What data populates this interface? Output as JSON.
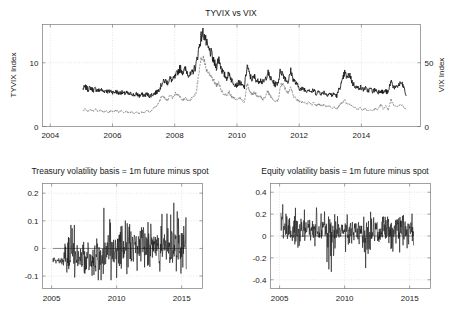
{
  "figure": {
    "background": "#ffffff",
    "line_color_primary": "#141414",
    "line_color_secondary": "#6f6f6f",
    "grid_color": "#c8c8c8"
  },
  "chart_data": [
    {
      "id": "tyvix_vs_vix",
      "type": "line",
      "title": "TYVIX vs VIX",
      "xlabel": "",
      "ylabel": "TYVIX Index",
      "y2label": "VIX Index",
      "xlim": [
        2003.75,
        2015.9
      ],
      "ylim": [
        0,
        16
      ],
      "y2lim": [
        0,
        80
      ],
      "xticks": [
        "2004",
        "2006",
        "2008",
        "2010",
        "2012",
        "2014"
      ],
      "xtick_values": [
        2004,
        2006,
        2008,
        2010,
        2012,
        2014
      ],
      "yticks": [
        "0",
        "10"
      ],
      "ytick_values": [
        0,
        10
      ],
      "y2ticks": [
        "0",
        "50"
      ],
      "y2tick_values": [
        0,
        50
      ],
      "grid": true,
      "legend": "none",
      "series": [
        {
          "name": "TYVIX Index",
          "axis": "left",
          "style": "solid",
          "color": "#141414",
          "x": [
            2005.05,
            2005.13,
            2005.21,
            2005.29,
            2005.38,
            2005.46,
            2005.54,
            2005.62,
            2005.71,
            2005.79,
            2005.87,
            2005.95,
            2006.04,
            2006.12,
            2006.2,
            2006.28,
            2006.37,
            2006.45,
            2006.53,
            2006.61,
            2006.7,
            2006.78,
            2006.86,
            2006.94,
            2007.03,
            2007.11,
            2007.19,
            2007.27,
            2007.36,
            2007.44,
            2007.52,
            2007.6,
            2007.69,
            2007.77,
            2007.85,
            2007.93,
            2008.02,
            2008.1,
            2008.18,
            2008.26,
            2008.35,
            2008.43,
            2008.51,
            2008.59,
            2008.68,
            2008.76,
            2008.84,
            2008.92,
            2009.01,
            2009.09,
            2009.17,
            2009.25,
            2009.34,
            2009.42,
            2009.5,
            2009.58,
            2009.67,
            2009.75,
            2009.83,
            2009.91,
            2010.0,
            2010.08,
            2010.16,
            2010.24,
            2010.33,
            2010.41,
            2010.49,
            2010.57,
            2010.66,
            2010.74,
            2010.82,
            2010.9,
            2010.99,
            2011.07,
            2011.15,
            2011.23,
            2011.32,
            2011.4,
            2011.48,
            2011.56,
            2011.65,
            2011.73,
            2011.81,
            2011.89,
            2011.98,
            2012.06,
            2012.14,
            2012.22,
            2012.31,
            2012.39,
            2012.47,
            2012.55,
            2012.64,
            2012.72,
            2012.8,
            2012.88,
            2012.97,
            2013.05,
            2013.13,
            2013.21,
            2013.3,
            2013.38,
            2013.46,
            2013.54,
            2013.63,
            2013.71,
            2013.79,
            2013.87,
            2013.96,
            2014.04,
            2014.12,
            2014.2,
            2014.29,
            2014.37,
            2014.45,
            2014.53,
            2014.62,
            2014.7,
            2014.78,
            2014.86,
            2014.95,
            2015.03,
            2015.11,
            2015.19,
            2015.28,
            2015.36,
            2015.44
          ],
          "y": [
            5.9,
            6.2,
            5.8,
            6.1,
            5.7,
            5.9,
            5.6,
            5.8,
            5.5,
            5.7,
            5.4,
            5.6,
            5.3,
            5.5,
            5.2,
            5.4,
            5.1,
            5.3,
            5.0,
            5.2,
            4.9,
            5.1,
            4.8,
            5.0,
            4.9,
            5.1,
            4.8,
            5.0,
            5.2,
            5.5,
            6.0,
            6.8,
            7.2,
            6.9,
            7.5,
            7.2,
            7.8,
            8.6,
            9.2,
            8.5,
            9.0,
            8.3,
            8.0,
            8.7,
            9.5,
            11.8,
            13.9,
            14.8,
            13.2,
            12.0,
            11.5,
            10.2,
            9.4,
            10.8,
            9.0,
            8.2,
            7.6,
            8.4,
            7.2,
            6.8,
            6.5,
            7.0,
            6.4,
            6.2,
            9.6,
            8.0,
            7.4,
            7.8,
            7.0,
            7.4,
            6.9,
            7.2,
            8.5,
            7.6,
            7.0,
            6.6,
            6.9,
            8.8,
            8.2,
            7.5,
            7.0,
            8.7,
            7.4,
            6.8,
            6.2,
            5.8,
            6.0,
            5.6,
            5.9,
            5.4,
            5.7,
            5.2,
            5.5,
            5.1,
            5.4,
            5.0,
            5.2,
            4.9,
            5.1,
            4.8,
            6.1,
            6.9,
            8.5,
            7.6,
            8.2,
            6.8,
            6.4,
            6.0,
            6.2,
            5.8,
            6.0,
            5.6,
            5.9,
            5.5,
            5.8,
            5.4,
            5.7,
            5.3,
            5.6,
            5.2,
            7.2,
            6.3,
            6.0,
            6.5,
            6.8,
            6.2,
            4.8
          ]
        },
        {
          "name": "VIX Index",
          "axis": "right",
          "style": "dashed",
          "color": "#6f6f6f",
          "x": [
            2005.05,
            2005.13,
            2005.21,
            2005.29,
            2005.38,
            2005.46,
            2005.54,
            2005.62,
            2005.71,
            2005.79,
            2005.87,
            2005.95,
            2006.04,
            2006.12,
            2006.2,
            2006.28,
            2006.37,
            2006.45,
            2006.53,
            2006.61,
            2006.7,
            2006.78,
            2006.86,
            2006.94,
            2007.03,
            2007.11,
            2007.19,
            2007.27,
            2007.36,
            2007.44,
            2007.52,
            2007.6,
            2007.69,
            2007.77,
            2007.85,
            2007.93,
            2008.02,
            2008.1,
            2008.18,
            2008.26,
            2008.35,
            2008.43,
            2008.51,
            2008.59,
            2008.68,
            2008.76,
            2008.84,
            2008.92,
            2009.01,
            2009.09,
            2009.17,
            2009.25,
            2009.34,
            2009.42,
            2009.5,
            2009.58,
            2009.67,
            2009.75,
            2009.83,
            2009.91,
            2010.0,
            2010.08,
            2010.16,
            2010.24,
            2010.33,
            2010.41,
            2010.49,
            2010.57,
            2010.66,
            2010.74,
            2010.82,
            2010.9,
            2010.99,
            2011.07,
            2011.15,
            2011.23,
            2011.32,
            2011.4,
            2011.48,
            2011.56,
            2011.65,
            2011.73,
            2011.81,
            2011.89,
            2011.98,
            2012.06,
            2012.14,
            2012.22,
            2012.31,
            2012.39,
            2012.47,
            2012.55,
            2012.64,
            2012.72,
            2012.8,
            2012.88,
            2012.97,
            2013.05,
            2013.13,
            2013.21,
            2013.3,
            2013.38,
            2013.46,
            2013.54,
            2013.63,
            2013.71,
            2013.79,
            2013.87,
            2013.96,
            2014.04,
            2014.12,
            2014.2,
            2014.29,
            2014.37,
            2014.45,
            2014.53,
            2014.62,
            2014.7,
            2014.78,
            2014.86,
            2014.95,
            2015.03,
            2015.11,
            2015.19,
            2015.28,
            2015.36,
            2015.44
          ],
          "y": [
            12.5,
            14.0,
            11.8,
            13.2,
            12.0,
            13.5,
            11.5,
            12.8,
            11.2,
            12.5,
            11.0,
            12.2,
            11.5,
            12.8,
            11.0,
            12.4,
            10.8,
            12.0,
            10.5,
            11.8,
            10.2,
            11.5,
            10.0,
            11.2,
            11.0,
            12.5,
            11.5,
            13.0,
            15.5,
            17.0,
            21.0,
            24.0,
            22.0,
            20.5,
            24.5,
            22.0,
            26.0,
            25.0,
            23.0,
            21.0,
            22.5,
            20.0,
            21.0,
            23.5,
            26.0,
            38.0,
            52.0,
            55.0,
            45.0,
            42.0,
            40.0,
            36.0,
            32.0,
            34.0,
            28.0,
            26.0,
            24.5,
            27.0,
            23.0,
            22.0,
            21.0,
            23.0,
            20.5,
            19.5,
            34.0,
            28.0,
            25.0,
            27.0,
            23.5,
            24.5,
            21.0,
            22.5,
            28.0,
            24.0,
            21.5,
            19.5,
            20.5,
            32.0,
            34.0,
            29.0,
            26.0,
            31.0,
            24.0,
            22.0,
            20.0,
            18.5,
            19.5,
            17.5,
            19.0,
            17.0,
            18.5,
            16.5,
            18.0,
            16.0,
            17.5,
            15.5,
            16.5,
            14.5,
            15.5,
            13.5,
            17.0,
            18.5,
            21.0,
            17.0,
            18.0,
            15.5,
            14.5,
            13.5,
            14.5,
            13.0,
            14.0,
            12.5,
            13.5,
            12.5,
            14.0,
            13.0,
            17.0,
            14.0,
            16.0,
            13.0,
            21.0,
            17.0,
            15.5,
            16.5,
            17.5,
            15.0,
            13.5
          ]
        }
      ]
    },
    {
      "id": "treasury_volatility_basis",
      "type": "line",
      "title": "Treasury volatility basis = 1m future minus spot",
      "xlabel": "",
      "ylabel": "",
      "xlim": [
        2004.3,
        2016.6
      ],
      "ylim": [
        -0.145,
        0.235
      ],
      "xticks": [
        "2005",
        "2010",
        "2015"
      ],
      "xtick_values": [
        2005,
        2010,
        2015
      ],
      "yticks": [
        "0.2",
        "0.1",
        "0",
        "-0.1"
      ],
      "ytick_values": [
        0.2,
        0.1,
        0,
        -0.1
      ],
      "grid": true,
      "zero_reference": 0,
      "series": [
        {
          "name": "Treasury volatility basis",
          "color": "#141414",
          "seed": 17,
          "x_start": 2005.1,
          "x_end": 2015.35,
          "n": 430,
          "description": "High-frequency noisy series; roughly -0.045 flat through 2005, widening oscillation -0.10..0.10 during 2006-2009 with spikes to 0.155 in 2009, then dense band -0.09..0.13 through 2010-2015 with peaks near 0.19 in 2014."
        }
      ]
    },
    {
      "id": "equity_volatility_basis",
      "type": "line",
      "title": "Equity volatility basis = 1m future minus spot",
      "xlabel": "",
      "ylabel": "",
      "xlim": [
        2004.3,
        2016.6
      ],
      "ylim": [
        -0.48,
        0.48
      ],
      "xticks": [
        "2005",
        "2010",
        "2015"
      ],
      "xtick_values": [
        2005,
        2010,
        2015
      ],
      "yticks": [
        "0.4",
        "0.2",
        "0",
        "-0.2",
        "-0.4"
      ],
      "ytick_values": [
        0.4,
        0.2,
        0,
        -0.2,
        -0.4
      ],
      "grid": true,
      "zero_reference": 0,
      "series": [
        {
          "name": "Equity volatility basis",
          "color": "#141414",
          "seed": 43,
          "x_start": 2005.1,
          "x_end": 2015.3,
          "n": 430,
          "description": "Noisy series centered near +0.05, band -0.2..0.25, deep negative spikes to -0.38 in late 2008 and -0.33 in 2011-2012, tall positive spike to 0.45 in 2012."
        }
      ]
    }
  ]
}
